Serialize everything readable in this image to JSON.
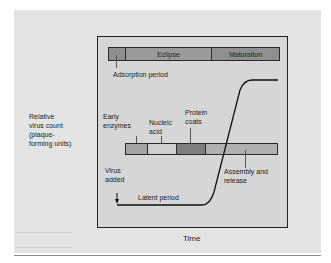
{
  "y_axis_label": [
    "Relative",
    "virus count",
    "(plaque-",
    "forming units)"
  ],
  "x_axis_label": "Time",
  "top_bar": {
    "segments": [
      {
        "label": "",
        "name": "Adsorption",
        "color": "#8e8e8e"
      },
      {
        "label": "Eclipse",
        "color": "#9a9a9a"
      },
      {
        "label": "Maturation",
        "color": "#8f8f8f"
      }
    ],
    "callout": "Adsorption period"
  },
  "middle_bar": {
    "segments": [
      {
        "name": "Early enzymes",
        "color": "#a4a4a4"
      },
      {
        "name": "Nucleic acid",
        "color": "#cfcfcf"
      },
      {
        "name": "Protein coats",
        "color": "#7e7e7e"
      },
      {
        "name": "Assembly and release",
        "color": "#b0b0b0"
      }
    ],
    "labels": {
      "early_1": "Early",
      "early_2": "enzymes",
      "nucleic_1": "Nucleic",
      "nucleic_2": "acid",
      "protein_1": "Protein",
      "protein_2": "coats",
      "assembly_1": "Assembly and",
      "assembly_2": "release"
    }
  },
  "annotations": {
    "virus_added_1": "Virus",
    "virus_added_2": "added",
    "latent_period": "Latent period"
  }
}
